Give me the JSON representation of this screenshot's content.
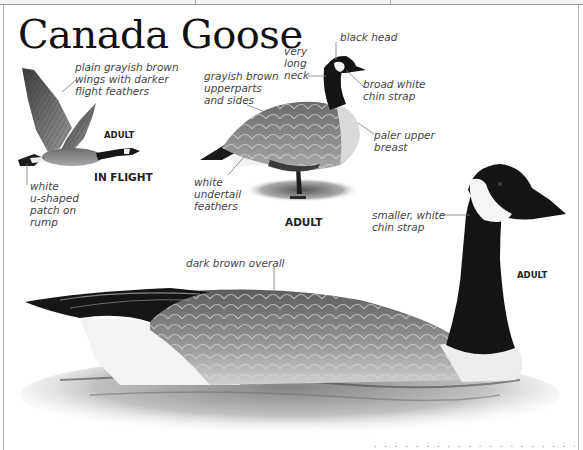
{
  "page": {
    "title": "Canada Goose"
  },
  "flight_figure": {
    "age_label": "ADULT",
    "pose_label": "IN FLIGHT",
    "annotations": {
      "wings": "plain grayish brown\nwings with darker\nflight feathers",
      "rump": "white\nu-shaped\npatch on\nrump"
    }
  },
  "standing_figure": {
    "age_label": "ADULT",
    "annotations": {
      "neck": "very\nlong\nneck",
      "head": "black head",
      "upperparts": "grayish brown\nupperparts\nand sides",
      "chin": "broad white\nchin strap",
      "breast": "paler upper\nbreast",
      "undertail": "white\nundertail\nfeathers"
    }
  },
  "swimming_figure": {
    "age_label": "ADULT",
    "annotations": {
      "chin": "smaller, white\nchin strap",
      "body": "dark brown overall"
    }
  },
  "colors": {
    "title": "#111111",
    "annotation_text": "#444444",
    "leader_line": "#777777",
    "goose_black": "#151515",
    "goose_body": "#7d7d7d",
    "goose_white": "#f2f2f2"
  }
}
